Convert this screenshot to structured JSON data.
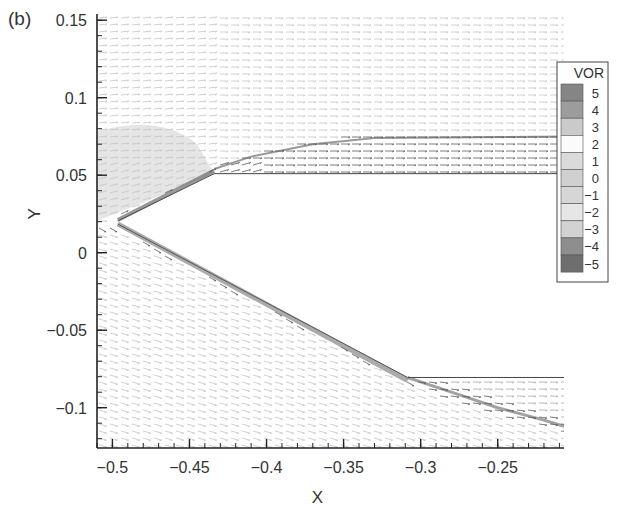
{
  "panel_label": "(b)",
  "chart_data": {
    "type": "vector_field",
    "title": "",
    "panel": "(b)",
    "xlabel": "X",
    "ylabel": "Y",
    "xlim": [
      -0.51,
      -0.207
    ],
    "ylim": [
      -0.126,
      0.154
    ],
    "grid": false,
    "x_ticks": [
      -0.5,
      -0.45,
      -0.4,
      -0.35,
      -0.3,
      -0.25
    ],
    "x_tick_labels": [
      "−0.5",
      "−0.45",
      "−0.4",
      "−0.35",
      "−0.3",
      "−0.25"
    ],
    "y_ticks": [
      0.15,
      0.1,
      0.05,
      0,
      -0.05,
      -0.1
    ],
    "y_tick_labels": [
      "0.15",
      "0.1",
      "0.05",
      "0",
      "−0.05",
      "−0.1"
    ],
    "geometry": {
      "wedge_tip": [
        -0.4965,
        0.0205
      ],
      "upper_surface": [
        [
          -0.4965,
          0.0205
        ],
        [
          -0.434,
          0.051
        ],
        [
          -0.207,
          0.051
        ]
      ],
      "lower_surface": [
        [
          -0.4965,
          0.0185
        ],
        [
          -0.3085,
          -0.0805
        ],
        [
          -0.207,
          -0.0805
        ]
      ]
    },
    "shear_layers": {
      "upper": [
        [
          -0.434,
          0.054
        ],
        [
          -0.41,
          0.062
        ],
        [
          -0.37,
          0.07
        ],
        [
          -0.33,
          0.074
        ],
        [
          -0.207,
          0.075
        ]
      ],
      "lower": [
        [
          -0.3085,
          -0.0805
        ],
        [
          -0.28,
          -0.09
        ],
        [
          -0.25,
          -0.1
        ],
        [
          -0.22,
          -0.108
        ],
        [
          -0.207,
          -0.112
        ]
      ]
    },
    "legend": {
      "title": "VOR",
      "position": "right",
      "levels": [
        {
          "value": "5",
          "color": "#858585"
        },
        {
          "value": "4",
          "color": "#9c9c9c"
        },
        {
          "value": "3",
          "color": "#cacaca"
        },
        {
          "value": "2",
          "color": "#fbfbfb"
        },
        {
          "value": "1",
          "color": "#dadada"
        },
        {
          "value": "0",
          "color": "#d0d0d0"
        },
        {
          "value": "−1",
          "color": "#d6d6d6"
        },
        {
          "value": "−2",
          "color": "#e6e6e6"
        },
        {
          "value": "−3",
          "color": "#d2d2d2"
        },
        {
          "value": "−4",
          "color": "#8e8e8e"
        },
        {
          "value": "−5",
          "color": "#6e6e6e"
        }
      ]
    },
    "colors": {
      "vector_light": "#c4c4c4",
      "vector_mid": "#a8a8a8",
      "vector_dark": "#5a5a5a",
      "axis": "#222222",
      "shaded_region": "#cfcfcf"
    }
  }
}
